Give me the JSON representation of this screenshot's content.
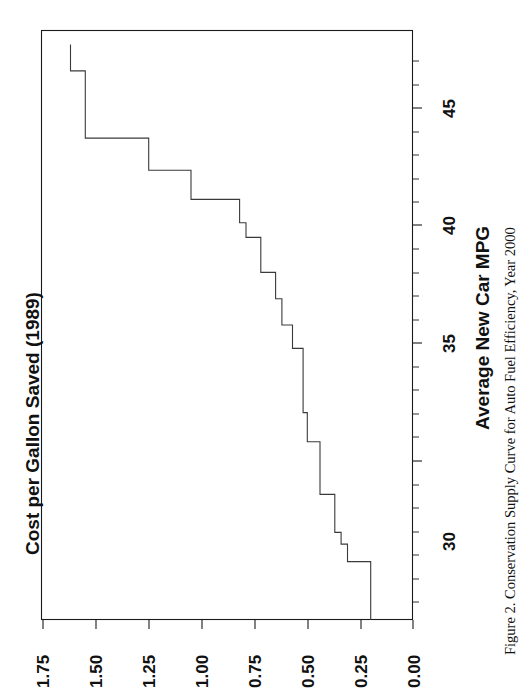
{
  "figure": {
    "caption": "Figure 2.   Conservation Supply Curve for Auto Fuel Efficiency, Year 2000",
    "caption_number": "Figure 2.",
    "caption_text": "Conservation Supply Curve for Auto Fuel Efficiency, Year 2000",
    "orientation": "rotated-90-ccw",
    "line_color": "#3a3a3a",
    "axis_color": "#1a1a1a",
    "background": "#ffffff"
  },
  "chart_data": {
    "type": "line",
    "subtype": "step",
    "title": "",
    "xlabel": "Average New Car MPG",
    "ylabel": "Cost per Gallon Saved (1989)",
    "xlim": [
      28.0,
      48.2
    ],
    "ylim": [
      0.0,
      1.75
    ],
    "xticks": [
      30,
      35,
      40,
      45
    ],
    "xtick_labels": [
      "30",
      "35",
      "40",
      "45"
    ],
    "xtick_minor_step": 1,
    "yticks": [
      0.0,
      0.25,
      0.5,
      0.75,
      1.0,
      1.25,
      1.5,
      1.75
    ],
    "ytick_labels": [
      "0.00",
      "0.25",
      "0.50",
      "0.75",
      "1.00",
      "1.25",
      "1.50",
      "1.75"
    ],
    "grid": false,
    "legend": false,
    "series": [
      {
        "name": "Conservation supply curve",
        "note": "Step (staircase) curve: cost per gallon saved rises as cumulative average new car MPG increases.",
        "steps": [
          {
            "mpg_start": 28.0,
            "mpg_end": 30.0,
            "cost": 0.2
          },
          {
            "mpg_start": 30.0,
            "mpg_end": 30.6,
            "cost": 0.31
          },
          {
            "mpg_start": 30.6,
            "mpg_end": 31.0,
            "cost": 0.34
          },
          {
            "mpg_start": 31.0,
            "mpg_end": 32.3,
            "cost": 0.37
          },
          {
            "mpg_start": 32.3,
            "mpg_end": 34.1,
            "cost": 0.44
          },
          {
            "mpg_start": 34.1,
            "mpg_end": 35.1,
            "cost": 0.5
          },
          {
            "mpg_start": 35.1,
            "mpg_end": 37.3,
            "cost": 0.52
          },
          {
            "mpg_start": 37.3,
            "mpg_end": 38.1,
            "cost": 0.57
          },
          {
            "mpg_start": 38.1,
            "mpg_end": 39.0,
            "cost": 0.62
          },
          {
            "mpg_start": 39.0,
            "mpg_end": 39.9,
            "cost": 0.65
          },
          {
            "mpg_start": 39.9,
            "mpg_end": 41.1,
            "cost": 0.72
          },
          {
            "mpg_start": 41.1,
            "mpg_end": 41.6,
            "cost": 0.79
          },
          {
            "mpg_start": 41.6,
            "mpg_end": 42.4,
            "cost": 0.82
          },
          {
            "mpg_start": 42.4,
            "mpg_end": 43.4,
            "cost": 1.05
          },
          {
            "mpg_start": 43.4,
            "mpg_end": 44.5,
            "cost": 1.25
          },
          {
            "mpg_start": 44.5,
            "mpg_end": 46.8,
            "cost": 1.55
          },
          {
            "mpg_start": 46.8,
            "mpg_end": 47.7,
            "cost": 1.62
          }
        ]
      }
    ]
  }
}
